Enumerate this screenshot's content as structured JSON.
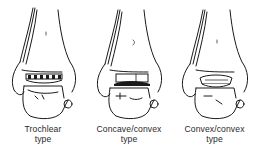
{
  "figure": {
    "panels": [
      {
        "id": "trochlear",
        "label_line1": "Trochlear",
        "label_line2": "type"
      },
      {
        "id": "concave-convex",
        "label_line1": "Concave/convex",
        "label_line2": "type"
      },
      {
        "id": "convex-convex",
        "label_line1": "Convex/convex",
        "label_line2": "type"
      }
    ],
    "colors": {
      "ink": "#1a1a1a",
      "background": "#ffffff"
    }
  }
}
